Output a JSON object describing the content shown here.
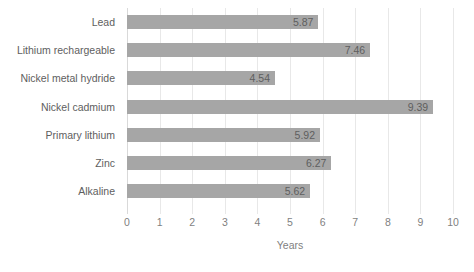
{
  "chart_data": {
    "type": "bar",
    "orientation": "horizontal",
    "title": "",
    "subtitle": "",
    "xlabel": "Years",
    "ylabel": "",
    "xlim": [
      0,
      10
    ],
    "xticks": [
      "0",
      "1",
      "2",
      "3",
      "4",
      "5",
      "6",
      "7",
      "8",
      "9",
      "10"
    ],
    "grid": "vertical",
    "legend": "none",
    "bar_color": "#a6a6a6",
    "label_color": "#5e5e5e",
    "tick_color": "#7f7f7f",
    "gridline_color": "#e8e8e8",
    "categories": [
      "Lead",
      "Lithium rechargeable",
      "Nickel metal hydride",
      "Nickel cadmium",
      "Primary lithium",
      "Zinc",
      "Alkaline"
    ],
    "values": [
      5.87,
      7.46,
      4.54,
      9.39,
      5.92,
      6.27,
      5.62
    ],
    "data_labels": [
      "5.87",
      "7.46",
      "4.54",
      "9.39",
      "5.92",
      "6.27",
      "5.62"
    ],
    "bars": [
      {
        "category": "Lead",
        "value": 5.87,
        "label": "5.87"
      },
      {
        "category": "Lithium rechargeable",
        "value": 7.46,
        "label": "7.46"
      },
      {
        "category": "Nickel metal hydride",
        "value": 4.54,
        "label": "4.54"
      },
      {
        "category": "Nickel cadmium",
        "value": 9.39,
        "label": "9.39"
      },
      {
        "category": "Primary lithium",
        "value": 5.92,
        "label": "5.92"
      },
      {
        "category": "Zinc",
        "value": 6.27,
        "label": "6.27"
      },
      {
        "category": "Alkaline",
        "value": 5.62,
        "label": "5.62"
      }
    ]
  }
}
